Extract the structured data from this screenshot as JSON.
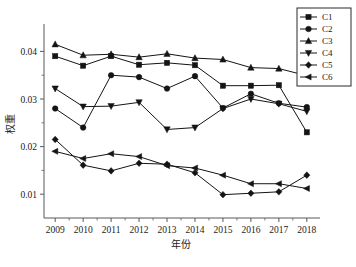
{
  "chart_data": {
    "type": "line",
    "title": "",
    "xlabel": "年份",
    "ylabel": "权重",
    "categories": [
      "2009",
      "2010",
      "2011",
      "2012",
      "2013",
      "2014",
      "2015",
      "2016",
      "2017",
      "2018"
    ],
    "x": [
      2009,
      2010,
      2011,
      2012,
      2013,
      2014,
      2015,
      2016,
      2017,
      2018
    ],
    "xlim": [
      2008.6,
      2018.4
    ],
    "ylim": [
      0.005,
      0.0445
    ],
    "ytick_labels": [
      "0.01",
      "0.02",
      "0.03",
      "0.04"
    ],
    "yticks": [
      0.01,
      0.02,
      0.03,
      0.04
    ],
    "grid": false,
    "legend_position": "top-right",
    "series": [
      {
        "name": "C1",
        "marker": "square",
        "values": [
          0.039,
          0.037,
          0.039,
          0.0372,
          0.0376,
          0.0371,
          0.0328,
          0.0328,
          0.0329,
          0.023
        ]
      },
      {
        "name": "C2",
        "marker": "circle",
        "values": [
          0.028,
          0.024,
          0.035,
          0.0346,
          0.0322,
          0.0348,
          0.0281,
          0.0311,
          0.0291,
          0.0283
        ]
      },
      {
        "name": "C3",
        "marker": "triangle-up",
        "values": [
          0.0415,
          0.0392,
          0.0394,
          0.0388,
          0.0395,
          0.0386,
          0.0383,
          0.0366,
          0.0364,
          0.0349
        ]
      },
      {
        "name": "C4",
        "marker": "triangle-down",
        "values": [
          0.0322,
          0.0284,
          0.0285,
          0.0293,
          0.0236,
          0.024,
          0.028,
          0.03,
          0.029,
          0.0274
        ]
      },
      {
        "name": "C5",
        "marker": "diamond",
        "values": [
          0.0215,
          0.0161,
          0.0149,
          0.0165,
          0.0163,
          0.0145,
          0.0099,
          0.0102,
          0.0105,
          0.014
        ]
      },
      {
        "name": "C6",
        "marker": "triangle-left",
        "values": [
          0.019,
          0.0175,
          0.0185,
          0.0179,
          0.016,
          0.0155,
          0.014,
          0.0122,
          0.0122,
          0.0112
        ]
      }
    ]
  },
  "legend": {
    "entries": [
      "C1",
      "C2",
      "C3",
      "C4",
      "C5",
      "C6"
    ]
  },
  "colors": {
    "line": "#141414",
    "axis": "#555b60",
    "background": "#ffffff"
  }
}
